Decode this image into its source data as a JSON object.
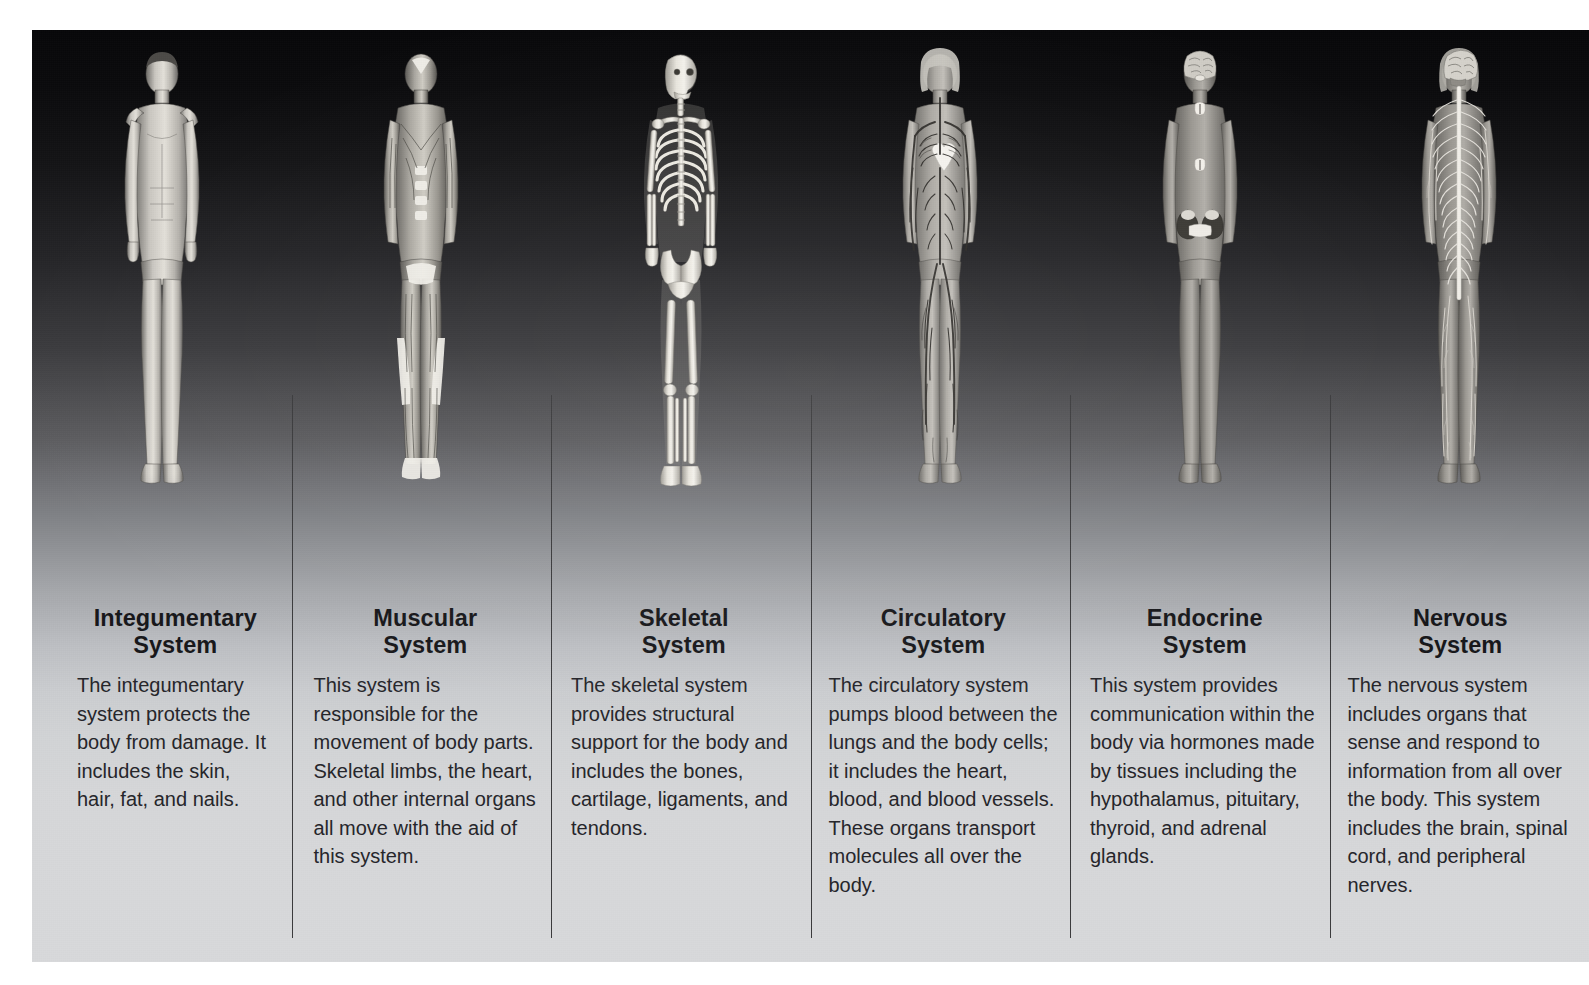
{
  "poster": {
    "background_top_color": "#08080a",
    "background_bottom_color": "#d8d9db",
    "divider_color": "#3a3a3c",
    "title_color": "#17171a",
    "body_color": "#25252a"
  },
  "systems": [
    {
      "id": "integumentary",
      "figure_name": "integumentary-system-figure",
      "title_line1": "Integumentary",
      "title_line2": "System",
      "description": "The integumentary system protects the body from damage. It includes the skin, hair, fat, and nails."
    },
    {
      "id": "muscular",
      "figure_name": "muscular-system-figure",
      "title_line1": "Muscular",
      "title_line2": "System",
      "description": "This system is responsible for the movement of body parts. Skeletal limbs, the heart, and other internal organs all move with the aid of this system."
    },
    {
      "id": "skeletal",
      "figure_name": "skeletal-system-figure",
      "title_line1": "Skeletal",
      "title_line2": "System",
      "description": "The skeletal system provides structural support for the body and includes the bones, cartilage, ligaments, and tendons."
    },
    {
      "id": "circulatory",
      "figure_name": "circulatory-system-figure",
      "title_line1": "Circulatory",
      "title_line2": "System",
      "description": "The circulatory system pumps blood between the lungs and the body cells; it includes the heart, blood, and blood vessels. These organs transport molecules all over the body."
    },
    {
      "id": "endocrine",
      "figure_name": "endocrine-system-figure",
      "title_line1": "Endocrine",
      "title_line2": "System",
      "description": "This system provides communication within the body via hormones made by tissues including the hypothalamus, pituitary, thyroid, and adrenal glands."
    },
    {
      "id": "nervous",
      "figure_name": "nervous-system-figure",
      "title_line1": "Nervous",
      "title_line2": "System",
      "description": "The nervous system includes organs that sense and respond to information from all over the body. This system includes the brain, spinal cord, and peripheral nerves."
    }
  ]
}
